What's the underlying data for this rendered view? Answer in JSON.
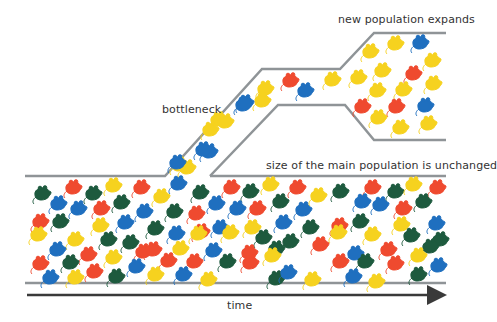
{
  "labels": {
    "bottleneck": "bottleneck",
    "new_population": "new population expands",
    "main_population": "size of the main population is unchanged",
    "time": "time"
  },
  "colors": {
    "outline": "#8f9497",
    "axis": "#3a3a3a",
    "red": "#ef4a2f",
    "blue": "#1f6fbf",
    "yellow": "#f6d21f",
    "green": "#1d5a3e"
  },
  "paths": {
    "main_top_left": "25,176 165,176 262,69 340,69 374,33 446,33",
    "main_top_right": "210,176 446,176",
    "bottleneck_lower": "210,176 278,105 345,105 374,140 446,140",
    "main_bottom": "25,283 446,283",
    "time_axis": {
      "x1": 27,
      "y1": 295,
      "x2": 446,
      "y2": 295
    }
  },
  "mice": {
    "expansion": [
      [
        "yellow",
        370,
        52
      ],
      [
        "yellow",
        395,
        44
      ],
      [
        "blue",
        420,
        43
      ],
      [
        "yellow",
        382,
        71
      ],
      [
        "yellow",
        432,
        61
      ],
      [
        "yellow",
        358,
        78
      ],
      [
        "red",
        413,
        74
      ],
      [
        "yellow",
        377,
        91
      ],
      [
        "yellow",
        403,
        90
      ],
      [
        "yellow",
        433,
        84
      ],
      [
        "red",
        362,
        107
      ],
      [
        "red",
        396,
        107
      ],
      [
        "blue",
        425,
        106
      ],
      [
        "yellow",
        378,
        118
      ],
      [
        "yellow",
        400,
        128
      ],
      [
        "yellow",
        428,
        124
      ]
    ],
    "bottleneck": [
      [
        "red",
        290,
        81
      ],
      [
        "blue",
        305,
        91
      ],
      [
        "yellow",
        265,
        89
      ],
      [
        "yellow",
        332,
        80
      ],
      [
        "blue",
        243,
        105
      ],
      [
        "yellow",
        262,
        101
      ],
      [
        "yellow",
        218,
        120
      ],
      [
        "blue",
        245,
        103
      ],
      [
        "yellow",
        225,
        122
      ],
      [
        "blue",
        209,
        152
      ],
      [
        "yellow",
        210,
        130
      ],
      [
        "yellow",
        187,
        168
      ],
      [
        "blue",
        203,
        150
      ],
      [
        "yellow",
        179,
        165
      ],
      [
        "blue",
        177,
        163
      ]
    ],
    "main": [
      [
        "green",
        42,
        194
      ],
      [
        "red",
        73,
        188
      ],
      [
        "green",
        93,
        194
      ],
      [
        "yellow",
        113,
        186
      ],
      [
        "red",
        141,
        188
      ],
      [
        "yellow",
        161,
        197
      ],
      [
        "blue",
        178,
        184
      ],
      [
        "green",
        200,
        193
      ],
      [
        "red",
        231,
        188
      ],
      [
        "green",
        250,
        192
      ],
      [
        "yellow",
        270,
        185
      ],
      [
        "red",
        297,
        188
      ],
      [
        "yellow",
        318,
        196
      ],
      [
        "green",
        340,
        192
      ],
      [
        "red",
        372,
        188
      ],
      [
        "green",
        395,
        192
      ],
      [
        "yellow",
        413,
        185
      ],
      [
        "red",
        437,
        188
      ],
      [
        "blue",
        58,
        204
      ],
      [
        "blue",
        78,
        209
      ],
      [
        "red",
        101,
        209
      ],
      [
        "green",
        121,
        203
      ],
      [
        "blue",
        144,
        212
      ],
      [
        "green",
        174,
        212
      ],
      [
        "red",
        196,
        214
      ],
      [
        "blue",
        216,
        204
      ],
      [
        "blue",
        237,
        209
      ],
      [
        "red",
        257,
        209
      ],
      [
        "green",
        280,
        202
      ],
      [
        "blue",
        303,
        210
      ],
      [
        "blue",
        362,
        202
      ],
      [
        "blue",
        380,
        205
      ],
      [
        "red",
        403,
        209
      ],
      [
        "green",
        423,
        202
      ],
      [
        "red",
        40,
        222
      ],
      [
        "green",
        60,
        222
      ],
      [
        "yellow",
        100,
        226
      ],
      [
        "blue",
        125,
        223
      ],
      [
        "green",
        155,
        229
      ],
      [
        "blue",
        176,
        234
      ],
      [
        "red",
        201,
        232
      ],
      [
        "blue",
        220,
        228
      ],
      [
        "yellow",
        252,
        228
      ],
      [
        "blue",
        283,
        223
      ],
      [
        "green",
        310,
        228
      ],
      [
        "red",
        339,
        226
      ],
      [
        "green",
        360,
        222
      ],
      [
        "yellow",
        401,
        225
      ],
      [
        "blue",
        436,
        224
      ],
      [
        "yellow",
        38,
        235
      ],
      [
        "yellow",
        75,
        240
      ],
      [
        "green",
        108,
        240
      ],
      [
        "green",
        130,
        243
      ],
      [
        "yellow",
        198,
        234
      ],
      [
        "red",
        143,
        252
      ],
      [
        "green",
        263,
        238
      ],
      [
        "green",
        290,
        242
      ],
      [
        "red",
        320,
        245
      ],
      [
        "yellow",
        338,
        233
      ],
      [
        "yellow",
        372,
        235
      ],
      [
        "green",
        411,
        236
      ],
      [
        "blue",
        57,
        250
      ],
      [
        "red",
        88,
        255
      ],
      [
        "red",
        153,
        250
      ],
      [
        "yellow",
        180,
        249
      ],
      [
        "blue",
        213,
        251
      ],
      [
        "red",
        249,
        253
      ],
      [
        "yellow",
        230,
        233
      ],
      [
        "green",
        276,
        249
      ],
      [
        "blue",
        355,
        254
      ],
      [
        "red",
        388,
        250
      ],
      [
        "green",
        440,
        240
      ],
      [
        "green",
        430,
        247
      ],
      [
        "red",
        40,
        264
      ],
      [
        "green",
        70,
        263
      ],
      [
        "yellow",
        113,
        258
      ],
      [
        "blue",
        136,
        267
      ],
      [
        "red",
        168,
        261
      ],
      [
        "red",
        194,
        262
      ],
      [
        "green",
        227,
        262
      ],
      [
        "red",
        250,
        263
      ],
      [
        "yellow",
        272,
        256
      ],
      [
        "red",
        340,
        262
      ],
      [
        "green",
        365,
        262
      ],
      [
        "red",
        395,
        264
      ],
      [
        "yellow",
        418,
        256
      ],
      [
        "blue",
        438,
        266
      ],
      [
        "blue",
        50,
        278
      ],
      [
        "yellow",
        75,
        278
      ],
      [
        "red",
        94,
        272
      ],
      [
        "green",
        116,
        277
      ],
      [
        "yellow",
        155,
        275
      ],
      [
        "blue",
        183,
        275
      ],
      [
        "yellow",
        208,
        280
      ],
      [
        "green",
        276,
        279
      ],
      [
        "blue",
        288,
        273
      ],
      [
        "yellow",
        312,
        280
      ],
      [
        "blue",
        353,
        277
      ],
      [
        "yellow",
        376,
        282
      ],
      [
        "green",
        418,
        275
      ]
    ]
  }
}
